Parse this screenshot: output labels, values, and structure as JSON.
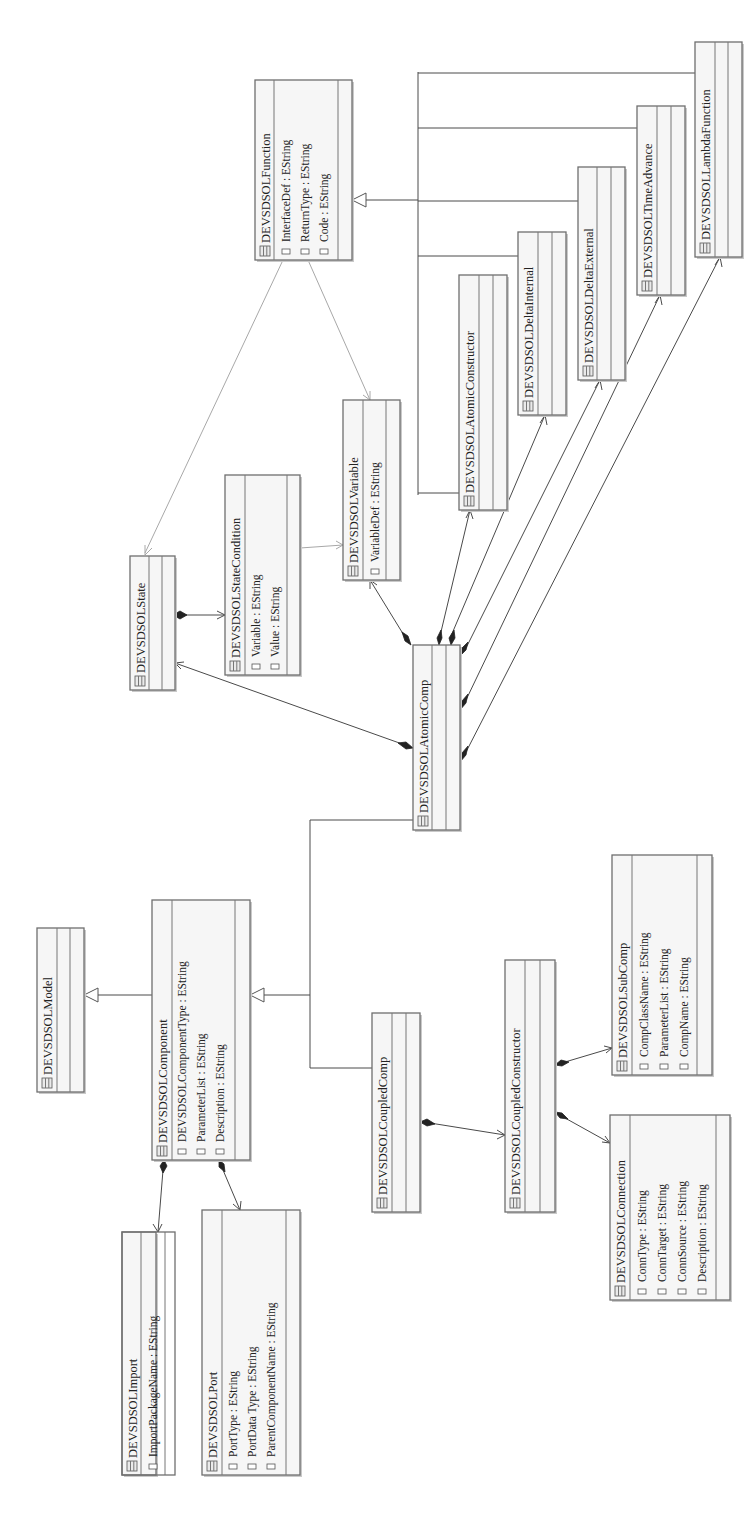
{
  "diagram": {
    "orientation": "rotated-90-ccw",
    "classes": {
      "model": {
        "name": "DEVSDSOLModel",
        "attributes": []
      },
      "component": {
        "name": "DEVSDSOLComponent",
        "attributes": [
          "DEVSDSOLComponentType : EString",
          "ParameterList : EString",
          "Description : EString"
        ]
      },
      "import": {
        "name": "DEVSDSOLImport",
        "attributes": [
          "ImportPackageName : EString"
        ]
      },
      "port": {
        "name": "DEVSDSOLPort",
        "attributes": [
          "PortType : EString",
          "PortData Type : EString",
          "ParentComponentName : EString"
        ]
      },
      "coupled_comp": {
        "name": "DEVSDSOLCoupledComp",
        "attributes": []
      },
      "coupled_constructor": {
        "name": "DEVSDSOLCoupledConstructor",
        "attributes": []
      },
      "sub_comp": {
        "name": "DEVSDSOLSubComp",
        "attributes": [
          "CompClassName : EString",
          "ParameterList : EString",
          "CompName : EString"
        ]
      },
      "connection": {
        "name": "DEVSDSOLConnection",
        "attributes": [
          "ConnType : EString",
          "ConnTarget : EString",
          "ConnSource : EString",
          "Description : EString"
        ]
      },
      "state": {
        "name": "DEVSDSOLState",
        "attributes": []
      },
      "state_condition": {
        "name": "DEVSDSOLStateCondition",
        "attributes": [
          "Variable : EString",
          "Value : EString"
        ]
      },
      "variable": {
        "name": "DEVSDSOLVariable",
        "attributes": [
          "VariableDef : EString"
        ]
      },
      "atomic_comp": {
        "name": "DEVSDSOLAtomicComp",
        "attributes": []
      },
      "function": {
        "name": "DEVSDSOLFunction",
        "attributes": [
          "InterfaceDef : EString",
          "ReturnType : EString",
          "Code : EString"
        ]
      },
      "atomic_constructor": {
        "name": "DEVSDSOLAtomicConstructor",
        "attributes": []
      },
      "delta_internal": {
        "name": "DEVSDSOLDeltaInternal",
        "attributes": []
      },
      "delta_external": {
        "name": "DEVSDSOLDeltaExternal",
        "attributes": []
      },
      "time_advance": {
        "name": "DEVSDSOLTimeAdvance",
        "attributes": []
      },
      "lambda_function": {
        "name": "DEVSDSOLLambdaFunction",
        "attributes": []
      }
    },
    "relations": [
      {
        "type": "generalization",
        "from": "DEVSDSOLComponent",
        "to": "DEVSDSOLModel"
      },
      {
        "type": "generalization",
        "from": "DEVSDSOLAtomicComp",
        "to": "DEVSDSOLComponent"
      },
      {
        "type": "generalization",
        "from": "DEVSDSOLCoupledComp",
        "to": "DEVSDSOLComponent"
      },
      {
        "type": "composition",
        "from": "DEVSDSOLComponent",
        "to": "DEVSDSOLImport"
      },
      {
        "type": "composition",
        "from": "DEVSDSOLComponent",
        "to": "DEVSDSOLPort"
      },
      {
        "type": "composition",
        "from": "DEVSDSOLCoupledComp",
        "to": "DEVSDSOLCoupledConstructor"
      },
      {
        "type": "composition",
        "from": "DEVSDSOLCoupledConstructor",
        "to": "DEVSDSOLSubComp"
      },
      {
        "type": "composition",
        "from": "DEVSDSOLCoupledConstructor",
        "to": "DEVSDSOLConnection"
      },
      {
        "type": "composition",
        "from": "DEVSDSOLAtomicComp",
        "to": "DEVSDSOLState"
      },
      {
        "type": "composition",
        "from": "DEVSDSOLState",
        "to": "DEVSDSOLStateCondition"
      },
      {
        "type": "composition",
        "from": "DEVSDSOLAtomicComp",
        "to": "DEVSDSOLVariable"
      },
      {
        "type": "composition",
        "from": "DEVSDSOLAtomicComp",
        "to": "DEVSDSOLAtomicConstructor"
      },
      {
        "type": "composition",
        "from": "DEVSDSOLAtomicComp",
        "to": "DEVSDSOLDeltaInternal"
      },
      {
        "type": "composition",
        "from": "DEVSDSOLAtomicComp",
        "to": "DEVSDSOLDeltaExternal"
      },
      {
        "type": "composition",
        "from": "DEVSDSOLAtomicComp",
        "to": "DEVSDSOLTimeAdvance"
      },
      {
        "type": "composition",
        "from": "DEVSDSOLAtomicComp",
        "to": "DEVSDSOLLambdaFunction"
      },
      {
        "type": "generalization",
        "from": "DEVSDSOLAtomicConstructor",
        "to": "DEVSDSOLFunction"
      },
      {
        "type": "generalization",
        "from": "DEVSDSOLDeltaInternal",
        "to": "DEVSDSOLFunction"
      },
      {
        "type": "generalization",
        "from": "DEVSDSOLDeltaExternal",
        "to": "DEVSDSOLFunction"
      },
      {
        "type": "generalization",
        "from": "DEVSDSOLTimeAdvance",
        "to": "DEVSDSOLFunction"
      },
      {
        "type": "generalization",
        "from": "DEVSDSOLLambdaFunction",
        "to": "DEVSDSOLFunction"
      },
      {
        "type": "reference",
        "from": "DEVSDSOLFunction",
        "to": "DEVSDSOLState"
      },
      {
        "type": "reference",
        "from": "DEVSDSOLFunction",
        "to": "DEVSDSOLVariable"
      },
      {
        "type": "reference",
        "from": "DEVSDSOLStateCondition",
        "to": "DEVSDSOLVariable"
      }
    ],
    "icons": {
      "class_icon": "class-icon",
      "attribute_icon": "attribute-icon"
    },
    "colors": {
      "box_fill": "#f6f6f6",
      "box_border": "#6f6f6f",
      "edge": "#4a4a4a",
      "reference_edge": "#a8a8a8",
      "text": "#222222"
    }
  }
}
